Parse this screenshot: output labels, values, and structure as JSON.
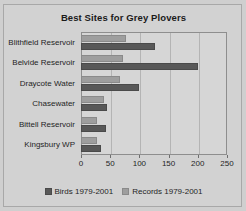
{
  "chart_data": {
    "type": "bar",
    "orientation": "horizontal",
    "title": "Best Sites for Grey Plovers",
    "xlabel": "",
    "ylabel": "",
    "xlim": [
      0,
      250
    ],
    "xticks": [
      0,
      50,
      100,
      150,
      200,
      250
    ],
    "grid": true,
    "legend_position": "bottom",
    "categories": [
      "Blithfield Reservoir",
      "Belvide Reservoir",
      "Draycote Water",
      "Chasewater",
      "Bittell Reservoir",
      "Kingsbury WP"
    ],
    "series": [
      {
        "name": "Birds 1979-2001",
        "color": "#585858",
        "values": [
          126,
          200,
          100,
          45,
          43,
          35
        ]
      },
      {
        "name": "Records 1979-2001",
        "color": "#9e9e9e",
        "values": [
          77,
          72,
          67,
          40,
          28,
          28
        ]
      }
    ]
  },
  "colors": {
    "background": "#d2d2d2",
    "plot_background": "#d6d6d6",
    "gridline": "#b4b4b4",
    "axis": "#8e8e8e",
    "text": "#1f1f1f"
  }
}
